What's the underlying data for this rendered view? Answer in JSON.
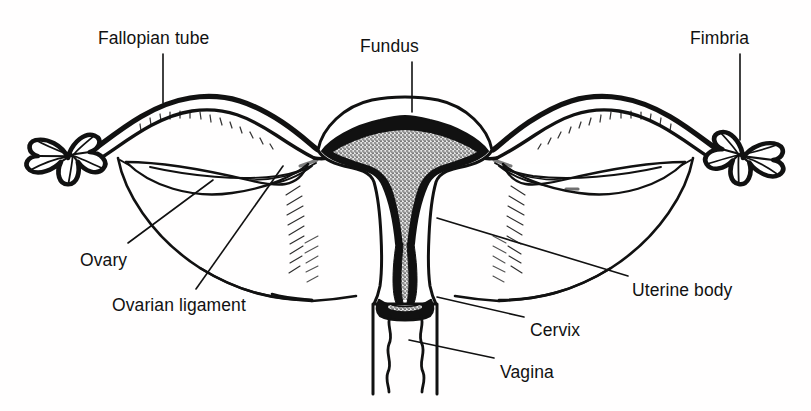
{
  "figure": {
    "kind": "anatomical-line-diagram",
    "background_color": "#ffffff",
    "ink_color": "#111111",
    "width": 811,
    "height": 411
  },
  "labels": [
    {
      "id": "fallopian-tube",
      "text": "Fallopian tube",
      "x": 98,
      "y": 30,
      "leader": "vertical down to left tube wall"
    },
    {
      "id": "fundus",
      "text": "Fundus",
      "x": 360,
      "y": 38,
      "leader": "vertical down to uterine dome"
    },
    {
      "id": "fimbria",
      "text": "Fimbria",
      "x": 690,
      "y": 30,
      "leader": "vertical down to right fimbriae"
    },
    {
      "id": "ovary",
      "text": "Ovary",
      "x": 80,
      "y": 252,
      "leader": "diagonal up-right to left ovary"
    },
    {
      "id": "ovarian-ligament",
      "text": "Ovarian ligament",
      "x": 112,
      "y": 297,
      "leader": "diagonal up-right to ligament cord"
    },
    {
      "id": "uterine-body",
      "text": "Uterine body",
      "x": 632,
      "y": 282,
      "leader": "diagonal up-left to uterine wall"
    },
    {
      "id": "cervix",
      "text": "Cervix",
      "x": 530,
      "y": 322,
      "leader": "diagonal up-left to cervical neck"
    },
    {
      "id": "vagina",
      "text": "Vagina",
      "x": 500,
      "y": 364,
      "leader": "diagonal up-left to vaginal canal"
    }
  ],
  "structures": [
    {
      "id": "uterus-body",
      "name": "Uterine body",
      "note": "thick black walls, stippled triangular cavity"
    },
    {
      "id": "uterine-cavity",
      "name": "Uterine cavity",
      "note": "inverted triangle, stippled fill"
    },
    {
      "id": "fundus-dome",
      "name": "Fundus",
      "note": "rounded superior dome of uterus"
    },
    {
      "id": "cervical-canal",
      "name": "Cervical canal",
      "note": "narrow isthmus widening into cervix"
    },
    {
      "id": "cervix",
      "name": "Cervix",
      "note": "projects into vaginal vault"
    },
    {
      "id": "vagina",
      "name": "Vagina",
      "note": "paired wavy inner walls, straight outer walls"
    },
    {
      "id": "fallopian-tube-left",
      "name": "Left fallopian tube",
      "note": "thick arching double-line band"
    },
    {
      "id": "fallopian-tube-right",
      "name": "Right fallopian tube",
      "note": "thick arching double-line band"
    },
    {
      "id": "fimbriae-left",
      "name": "Left fimbriae",
      "note": "fringed petal cluster at tube end"
    },
    {
      "id": "fimbriae-right",
      "name": "Right fimbriae",
      "note": "fringed petal cluster at tube end"
    },
    {
      "id": "ovary-left",
      "name": "Left ovary",
      "note": "almond/lens shape below tube"
    },
    {
      "id": "ovary-right",
      "name": "Right ovary",
      "note": "almond/lens shape below tube"
    },
    {
      "id": "ovarian-ligament-left",
      "name": "Left ovarian ligament",
      "note": "cord from ovary to uterine cornu"
    },
    {
      "id": "ovarian-ligament-right",
      "name": "Right ovarian ligament",
      "note": "cord from ovary to uterine cornu"
    },
    {
      "id": "broad-ligament-left",
      "name": "Left broad ligament",
      "note": "draped sheet, hatched near uterus"
    },
    {
      "id": "broad-ligament-right",
      "name": "Right broad ligament",
      "note": "draped sheet, hatched near uterus"
    }
  ]
}
